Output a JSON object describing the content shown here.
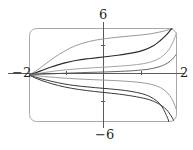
{
  "figure": {
    "name": "solution-curve-family-plot",
    "frame": {
      "x0": 29,
      "y0": 28,
      "x1": 177,
      "y1": 122,
      "corner_radius": 7,
      "color": "#a8a8a8"
    },
    "axes": {
      "x_axis_y": 73,
      "y_axis_x": 103,
      "color": "#5a5a5a",
      "x_ticks_px": [
        66,
        141
      ],
      "y_ticks_px": [
        45,
        101
      ]
    },
    "labels": {
      "top": "6",
      "bottom": "−6",
      "left": "−2",
      "right": "2"
    }
  },
  "chart_data": {
    "type": "line",
    "title": "",
    "xlabel": "",
    "ylabel": "",
    "xlim": [
      -2,
      2
    ],
    "ylim": [
      -6,
      6
    ],
    "xticks": [
      -2,
      -1,
      1,
      2
    ],
    "yticks": [
      -6,
      -3,
      3,
      6
    ],
    "xtick_labels": [
      "−2",
      "",
      "",
      "2"
    ],
    "ytick_labels": [
      "−6",
      "",
      "",
      "6"
    ],
    "grid": false,
    "legend": null,
    "singular_point": [
      -2,
      0
    ],
    "series": [
      {
        "name": "curve-1-upper-grey",
        "color": "#8c8c8c",
        "width": 0.9,
        "x": [
          -2.0,
          -1.8,
          -1.6,
          -1.4,
          -1.2,
          -1.0,
          -0.8,
          -0.6,
          -0.4,
          -0.2,
          0.0,
          0.3,
          0.6,
          0.9,
          1.2,
          1.5,
          1.75,
          1.9,
          2.0
        ],
        "y": [
          0.0,
          0.55,
          1.25,
          1.95,
          2.6,
          3.15,
          3.62,
          3.98,
          4.25,
          4.45,
          4.6,
          4.78,
          4.92,
          5.05,
          5.2,
          5.45,
          5.75,
          6.0,
          6.2
        ]
      },
      {
        "name": "curve-2-upper-dark",
        "color": "#2b2b2b",
        "width": 1.15,
        "x": [
          -2.0,
          -1.8,
          -1.6,
          -1.4,
          -1.2,
          -1.0,
          -0.7,
          -0.4,
          0.0,
          0.4,
          0.8,
          1.1,
          1.35,
          1.55,
          1.7,
          1.8,
          1.88,
          1.94
        ],
        "y": [
          0.0,
          0.32,
          0.68,
          1.02,
          1.32,
          1.58,
          1.88,
          2.08,
          2.3,
          2.52,
          2.82,
          3.18,
          3.7,
          4.4,
          5.05,
          5.6,
          6.05,
          6.4
        ]
      },
      {
        "name": "curve-3-upper-grey-low",
        "color": "#9a9a9a",
        "width": 0.9,
        "x": [
          -2.0,
          -1.8,
          -1.55,
          -1.3,
          -1.0,
          -0.6,
          -0.2,
          0.2,
          0.6,
          1.0,
          1.3,
          1.55,
          1.72,
          1.84,
          1.94,
          2.0
        ],
        "y": [
          0.0,
          0.16,
          0.34,
          0.5,
          0.66,
          0.82,
          0.94,
          1.05,
          1.18,
          1.38,
          1.68,
          2.2,
          2.9,
          3.7,
          4.75,
          5.5
        ]
      },
      {
        "name": "curve-4-lower-dark",
        "color": "#3a3a3a",
        "width": 1.0,
        "x": [
          -2.0,
          -1.8,
          -1.55,
          -1.3,
          -1.0,
          -0.6,
          -0.2,
          0.2,
          0.6,
          1.0,
          1.25,
          1.45,
          1.58,
          1.68,
          1.75,
          1.8
        ],
        "y": [
          0.0,
          -0.3,
          -0.62,
          -0.9,
          -1.18,
          -1.44,
          -1.62,
          -1.78,
          -1.98,
          -2.32,
          -2.72,
          -3.3,
          -3.95,
          -4.8,
          -5.55,
          -6.2
        ]
      },
      {
        "name": "curve-5-lower-dark-outer",
        "color": "#3a3a3a",
        "width": 1.0,
        "x": [
          -2.0,
          -1.78,
          -1.5,
          -1.2,
          -0.85,
          -0.45,
          0.0,
          0.45,
          0.9,
          1.25,
          1.52,
          1.7,
          1.82,
          1.9,
          1.96
        ],
        "y": [
          0.0,
          -0.48,
          -0.95,
          -1.35,
          -1.7,
          -1.98,
          -2.22,
          -2.45,
          -2.78,
          -3.15,
          -3.72,
          -4.35,
          -5.05,
          -5.7,
          -6.3
        ]
      },
      {
        "name": "curve-6-lower-grey-shallow",
        "color": "#8f8f8f",
        "width": 0.9,
        "x": [
          -2.0,
          -1.75,
          -1.45,
          -1.1,
          -0.7,
          -0.25,
          0.25,
          0.75,
          1.15,
          1.45,
          1.65,
          1.8,
          1.9,
          1.97
        ],
        "y": [
          0.0,
          -0.12,
          -0.25,
          -0.38,
          -0.5,
          -0.6,
          -0.7,
          -0.84,
          -1.05,
          -1.4,
          -1.9,
          -2.6,
          -3.4,
          -4.3
        ]
      },
      {
        "name": "curve-7-mid-dark-thin",
        "color": "#4a4a4a",
        "width": 0.85,
        "x": [
          -2.0,
          -1.7,
          -1.35,
          -1.0,
          -0.6,
          -0.15,
          0.35,
          0.85,
          1.25,
          1.55,
          1.75,
          1.88,
          1.97
        ],
        "y": [
          0.0,
          0.08,
          0.16,
          0.23,
          0.3,
          0.36,
          0.44,
          0.56,
          0.76,
          1.1,
          1.55,
          2.05,
          2.6
        ]
      }
    ]
  }
}
